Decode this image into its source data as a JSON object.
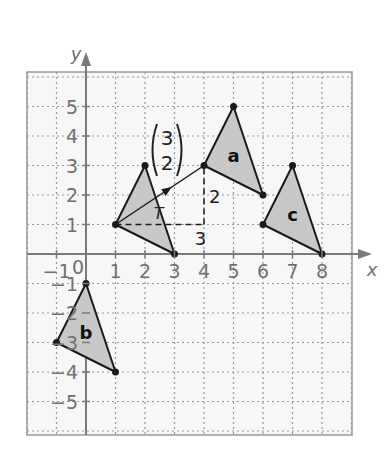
{
  "axes": {
    "x_label": "x",
    "y_label": "y",
    "origin_label": "0",
    "x_ticks": [
      -1,
      1,
      2,
      3,
      4,
      5,
      6,
      7,
      8
    ],
    "y_ticks": [
      5,
      4,
      3,
      2,
      1,
      -1,
      -2,
      -3,
      -4,
      -5
    ],
    "x_range": [
      -2,
      9
    ],
    "y_range": [
      -6,
      6
    ]
  },
  "translation_vector": {
    "top": "3",
    "bottom": "2",
    "from": [
      1,
      1
    ],
    "to": [
      4,
      3
    ],
    "horizontal_label": "3",
    "vertical_label": "2"
  },
  "shapes": [
    {
      "id": "original",
      "label": "",
      "vertices": [
        [
          1,
          1
        ],
        [
          2,
          3
        ],
        [
          3,
          0
        ]
      ]
    },
    {
      "id": "a",
      "label": "a",
      "vertices": [
        [
          4,
          3
        ],
        [
          5,
          5
        ],
        [
          6,
          2
        ]
      ]
    },
    {
      "id": "b",
      "label": "b",
      "vertices": [
        [
          -1,
          -3
        ],
        [
          0,
          -1
        ],
        [
          1,
          -4
        ]
      ]
    },
    {
      "id": "c",
      "label": "c",
      "vertices": [
        [
          6,
          1
        ],
        [
          7,
          3
        ],
        [
          8,
          0
        ]
      ]
    }
  ],
  "colors": {
    "grid": "#9a9a9a",
    "axis": "#7a7a7a",
    "fill": "#c8c8c8",
    "stroke": "#1a1a1a",
    "tick_text": "#707070"
  }
}
